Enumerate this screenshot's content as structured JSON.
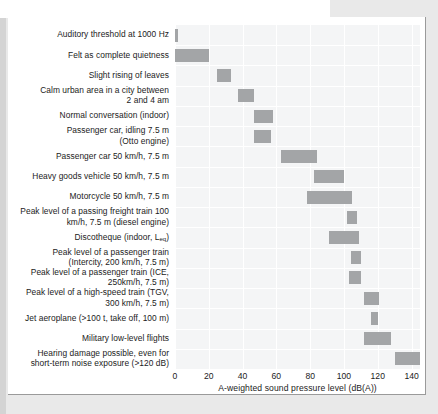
{
  "chart_data": {
    "type": "bar",
    "orientation": "horizontal",
    "title": "",
    "xlabel": "A-weighted sound pressure level (dB(A))",
    "ylabel": "",
    "xlim": [
      0,
      145
    ],
    "xticks": [
      0,
      20,
      40,
      60,
      80,
      100,
      120,
      140
    ],
    "xtick_labels": [
      "0",
      "20",
      "40",
      "60",
      "80",
      "100",
      "120",
      "140"
    ],
    "grid": true,
    "legend": "none",
    "bar_color": "#a3a5a7",
    "plot_background": "#f4f5f6",
    "note": "Each bar is a range (low to high dB(A)) for the given noise source",
    "categories": [
      "Auditory threshold at 1000 Hz",
      "Felt as complete quietness",
      "Slight rising of leaves",
      "Calm urban area in a city between 2 and 4 am",
      "Normal conversation (indoor)",
      "Passenger car, idling 7.5 m (Otto engine)",
      "Passenger car 50 km/h, 7.5 m",
      "Heavy goods vehicle 50 km/h, 7.5 m",
      "Motorcycle 50 km/h, 7.5 m",
      "Peak level of a passing freight train 100 km/h, 7.5 m (diesel engine)",
      "Discotheque (indoor, Leq)",
      "Peak level of a passenger train (Intercity, 200 km/h, 7.5 m)",
      "Peak level of a passenger train (ICE, 250km/h, 7.5 m)",
      "Peak level of a high-speed train (TGV, 300 km/h, 7.5 m)",
      "Jet aeroplane (>100 t, take off, 100 m)",
      "Military low-level flights",
      "Hearing damage possible, even for short-term noise exposure (>120 dB)"
    ],
    "ranges": [
      [
        0,
        2
      ],
      [
        0,
        20
      ],
      [
        25,
        33
      ],
      [
        37,
        47
      ],
      [
        47,
        58
      ],
      [
        47,
        57
      ],
      [
        63,
        84
      ],
      [
        82,
        100
      ],
      [
        78,
        105
      ],
      [
        102,
        108
      ],
      [
        91,
        109
      ],
      [
        104,
        110
      ],
      [
        103,
        110
      ],
      [
        112,
        121
      ],
      [
        116,
        120
      ],
      [
        112,
        128
      ],
      [
        130,
        145
      ]
    ]
  },
  "labels": [
    {
      "lines": [
        "Auditory threshold at 1000 Hz"
      ]
    },
    {
      "lines": [
        "Felt as complete quietness"
      ]
    },
    {
      "lines": [
        "Slight rising of leaves"
      ]
    },
    {
      "lines": [
        "Calm urban area in a city between",
        "2 and 4 am"
      ]
    },
    {
      "lines": [
        "Normal conversation (indoor)"
      ]
    },
    {
      "lines": [
        "Passenger car, idling 7.5 m",
        "(Otto engine)"
      ]
    },
    {
      "lines": [
        "Passenger car 50 km/h, 7.5 m"
      ]
    },
    {
      "lines": [
        "Heavy goods vehicle 50 km/h, 7.5 m"
      ]
    },
    {
      "lines": [
        "Motorcycle 50 km/h, 7.5 m"
      ]
    },
    {
      "lines": [
        "Peak level of a passing freight train 100",
        "km/h, 7.5 m (diesel engine)"
      ]
    },
    {
      "lines": [
        "Discotheque (indoor, Lₑₒ)"
      ],
      "html": "Discotheque (indoor, L<sub>eq</sub>)"
    },
    {
      "lines": [
        "Peak level of a passenger train",
        "(Intercity, 200 km/h, 7.5 m)"
      ]
    },
    {
      "lines": [
        "Peak level of a passenger train (ICE,",
        "250km/h, 7.5 m)"
      ]
    },
    {
      "lines": [
        "Peak level of a high-speed train (TGV,",
        "300 km/h, 7.5 m)"
      ]
    },
    {
      "lines": [
        "Jet aeroplane (>100 t, take off, 100 m)"
      ]
    },
    {
      "lines": [
        "Military low-level flights"
      ]
    },
    {
      "lines": [
        "Hearing damage possible, even for",
        "short-term noise exposure (>120 dB)"
      ]
    }
  ]
}
